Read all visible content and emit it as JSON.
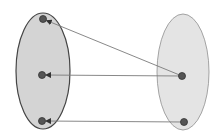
{
  "diagram": {
    "type": "set-mapping",
    "width": 224,
    "height": 139,
    "colors": {
      "background": "#ffffff",
      "left_set_fill": "#d4d4d4",
      "left_set_stroke": "#444444",
      "right_set_fill": "#e4e4e4",
      "right_set_stroke": "#9a9a9a",
      "point_fill": "#555555",
      "point_stroke": "#333333",
      "edge_color": "#7a7a7a"
    },
    "sets": [
      {
        "id": "left",
        "cx": 43,
        "cy": 71,
        "rx": 27,
        "ry": 58
      },
      {
        "id": "right",
        "cx": 183,
        "cy": 72,
        "rx": 26,
        "ry": 58
      }
    ],
    "points": [
      {
        "id": "a1",
        "set": "left",
        "x": 43,
        "y": 19
      },
      {
        "id": "a2",
        "set": "left",
        "x": 42,
        "y": 75
      },
      {
        "id": "a3",
        "set": "left",
        "x": 42,
        "y": 121
      },
      {
        "id": "b1",
        "set": "right",
        "x": 182,
        "y": 76
      },
      {
        "id": "b2",
        "set": "right",
        "x": 184,
        "y": 122
      }
    ],
    "edges": [
      {
        "from": "b1",
        "to": "a1"
      },
      {
        "from": "b1",
        "to": "a2"
      },
      {
        "from": "b2",
        "to": "a3"
      }
    ]
  }
}
